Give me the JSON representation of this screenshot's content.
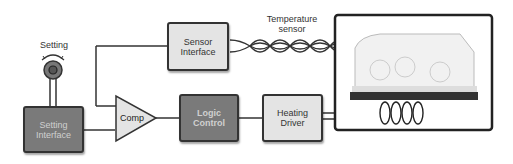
{
  "diagram": {
    "type": "block-diagram",
    "title": "",
    "labels": {
      "setting": "Setting",
      "temperature_sensor_line1": "Temperature",
      "temperature_sensor_line2": "sensor"
    },
    "blocks": {
      "setting_interface": {
        "line1": "Setting",
        "line2": "Interface",
        "style": "dark"
      },
      "comp": {
        "label": "Comp",
        "shape": "triangle"
      },
      "sensor_interface": {
        "line1": "Sensor",
        "line2": "Interface",
        "style": "light"
      },
      "logic_control": {
        "line1": "Logic",
        "line2": "Control",
        "style": "dark"
      },
      "heating_driver": {
        "line1": "Heating",
        "line2": "Driver",
        "style": "light"
      },
      "incubator": {
        "label": "Incubator image",
        "style": "framed-photo"
      }
    },
    "connections": [
      {
        "from": "setting_knob",
        "to": "setting_interface"
      },
      {
        "from": "setting_interface",
        "to": "comp"
      },
      {
        "from": "sensor_interface",
        "to": "comp"
      },
      {
        "from": "comp",
        "to": "logic_control"
      },
      {
        "from": "logic_control",
        "to": "heating_driver"
      },
      {
        "from": "heating_driver",
        "to": "incubator",
        "type": "heating-coil"
      },
      {
        "from": "incubator",
        "to": "sensor_interface",
        "type": "twisted-pair"
      }
    ],
    "colors": {
      "line": "#333333",
      "light_fill": "#e4e4e4",
      "dark_fill": "#7a7a7a",
      "dark_text": "#d0d0d0"
    }
  }
}
